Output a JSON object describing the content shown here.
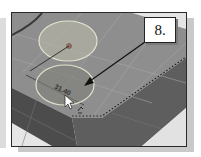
{
  "figure": {
    "step_label": "8.",
    "dimension_value": "31.40",
    "colors": {
      "top_face": "#8c8c8c",
      "side_face_dark": "#4a4a4a",
      "floor": "#e6e6e6",
      "circle_highlight": "#d9d9c0",
      "frame_border": "#2a2a2a",
      "arrow": "#111111"
    }
  },
  "viewport": {
    "description": "CAD 3D view: block top face with two sketched circles, a dimension, a cursor and a dashed edge",
    "cursor": "arrow-pointer"
  }
}
